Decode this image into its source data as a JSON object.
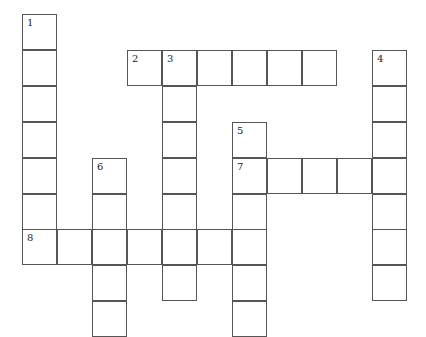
{
  "puzzle": {
    "type": "crossword",
    "cell_size": 35,
    "origin": {
      "x": 22,
      "y": 14
    },
    "columns": 11,
    "rows": 9,
    "entries": [
      {
        "number": 1,
        "direction": "down",
        "col": 0,
        "row": 0,
        "length": 7
      },
      {
        "number": 2,
        "direction": "across",
        "col": 3,
        "row": 1,
        "length": 6
      },
      {
        "number": 3,
        "direction": "down",
        "col": 4,
        "row": 1,
        "length": 7
      },
      {
        "number": 4,
        "direction": "down",
        "col": 10,
        "row": 1,
        "length": 7
      },
      {
        "number": 5,
        "direction": "down",
        "col": 6,
        "row": 3,
        "length": 6
      },
      {
        "number": 6,
        "direction": "down",
        "col": 2,
        "row": 4,
        "length": 5
      },
      {
        "number": 7,
        "direction": "across",
        "col": 6,
        "row": 4,
        "length": 5
      },
      {
        "number": 8,
        "direction": "across",
        "col": 0,
        "row": 6,
        "length": 7
      }
    ]
  },
  "colors": {
    "border": "#555555",
    "cell": "#ffffff",
    "number": "#222222"
  }
}
